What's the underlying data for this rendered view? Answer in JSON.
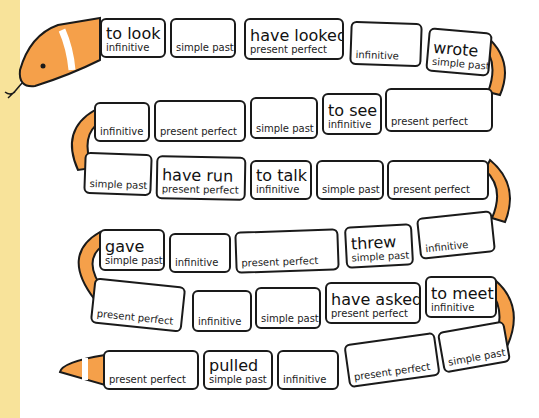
{
  "game": {
    "title": "Verb tense snake",
    "colors": {
      "snake": "#f5a04a",
      "outline": "#1a1a1a",
      "tile": "#ffffff",
      "side_strip": "#f8e39a"
    },
    "rows": [
      {
        "tiles": [
          {
            "word": "to look",
            "tense": "infinitive"
          },
          {
            "word": "",
            "tense": "simple past"
          },
          {
            "word": "have looked",
            "tense": "present perfect"
          },
          {
            "word": "",
            "tense": "infinitive"
          },
          {
            "word": "wrote",
            "tense": "simple past"
          }
        ]
      },
      {
        "tiles": [
          {
            "word": "",
            "tense": "infinitive"
          },
          {
            "word": "",
            "tense": "present perfect"
          },
          {
            "word": "",
            "tense": "simple past"
          },
          {
            "word": "to see",
            "tense": "infinitive"
          },
          {
            "word": "",
            "tense": "present perfect"
          }
        ]
      },
      {
        "tiles": [
          {
            "word": "",
            "tense": "simple past"
          },
          {
            "word": "have run",
            "tense": "present perfect"
          },
          {
            "word": "to talk",
            "tense": "infinitive"
          },
          {
            "word": "",
            "tense": "simple past"
          },
          {
            "word": "",
            "tense": "present perfect"
          }
        ]
      },
      {
        "tiles": [
          {
            "word": "gave",
            "tense": "simple past"
          },
          {
            "word": "",
            "tense": "infinitive"
          },
          {
            "word": "",
            "tense": "present perfect"
          },
          {
            "word": "threw",
            "tense": "simple past"
          },
          {
            "word": "",
            "tense": "infinitive"
          }
        ]
      },
      {
        "tiles": [
          {
            "word": "",
            "tense": "present perfect"
          },
          {
            "word": "",
            "tense": "infinitive"
          },
          {
            "word": "",
            "tense": "simple past"
          },
          {
            "word": "have asked",
            "tense": "present perfect"
          },
          {
            "word": "to meet",
            "tense": "infinitive"
          }
        ]
      },
      {
        "tiles": [
          {
            "word": "",
            "tense": "present perfect"
          },
          {
            "word": "pulled",
            "tense": "simple past"
          },
          {
            "word": "",
            "tense": "infinitive"
          },
          {
            "word": "",
            "tense": "present perfect"
          },
          {
            "word": "",
            "tense": "simple past"
          }
        ]
      }
    ]
  }
}
